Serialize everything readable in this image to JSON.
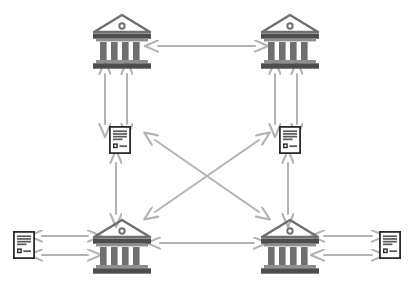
{
  "diagram": {
    "background_color": "#ffffff",
    "colors": {
      "bank_dark": "#4d4d4d",
      "bank_mid": "#6f6f6f",
      "bank_light": "#8f8f8f",
      "document_frame": "#2b2b2b",
      "document_line": "#5a5a5a",
      "document_paper": "#ffffff",
      "arrow": "#b3b3b3",
      "arrow_dark": "#a6a6a6"
    },
    "nodes": [
      {
        "id": "bank-top-left",
        "type": "bank-icon",
        "label": "Bank",
        "x": 122,
        "y": 42,
        "width": 62,
        "height": 58
      },
      {
        "id": "bank-top-right",
        "type": "bank-icon",
        "label": "Bank",
        "x": 290,
        "y": 42,
        "width": 62,
        "height": 58
      },
      {
        "id": "document-mid-left",
        "type": "document-icon",
        "label": "Document",
        "x": 120,
        "y": 140,
        "width": 22,
        "height": 28
      },
      {
        "id": "document-mid-right",
        "type": "document-icon",
        "label": "Document",
        "x": 290,
        "y": 140,
        "width": 22,
        "height": 28
      },
      {
        "id": "bank-bottom-left",
        "type": "bank-icon",
        "label": "Bank",
        "x": 122,
        "y": 247,
        "width": 62,
        "height": 58
      },
      {
        "id": "bank-bottom-right",
        "type": "bank-icon",
        "label": "Bank",
        "x": 290,
        "y": 247,
        "width": 62,
        "height": 58
      },
      {
        "id": "document-far-left",
        "type": "document-icon",
        "label": "Document",
        "x": 24,
        "y": 245,
        "width": 22,
        "height": 28
      },
      {
        "id": "document-far-right",
        "type": "document-icon",
        "label": "Document",
        "x": 390,
        "y": 245,
        "width": 22,
        "height": 28
      }
    ],
    "connectors": [
      {
        "id": "conn-top-banks",
        "name": "arrow-top-left-bank-to-top-right-bank",
        "style": "double-headed",
        "x1": 158,
        "y1": 46,
        "x2": 255,
        "y2": 46
      },
      {
        "id": "conn-tl-bank-doc-a",
        "name": "arrow-top-left-bank-to-left-document-a",
        "style": "double-headed",
        "x1": 105,
        "y1": 74,
        "x2": 105,
        "y2": 124
      },
      {
        "id": "conn-tl-bank-doc-b",
        "name": "arrow-top-left-bank-to-left-document-b",
        "style": "double-headed",
        "x1": 127,
        "y1": 74,
        "x2": 127,
        "y2": 124
      },
      {
        "id": "conn-tr-bank-doc-a",
        "name": "arrow-top-right-bank-to-right-document-a",
        "style": "double-headed",
        "x1": 275,
        "y1": 74,
        "x2": 275,
        "y2": 124
      },
      {
        "id": "conn-tr-bank-doc-b",
        "name": "arrow-top-right-bank-to-right-document-b",
        "style": "double-headed",
        "x1": 297,
        "y1": 74,
        "x2": 297,
        "y2": 124
      },
      {
        "id": "conn-left-doc-bl-bank",
        "name": "arrow-left-document-to-bottom-left-bank",
        "style": "double-headed",
        "x1": 116,
        "y1": 163,
        "x2": 116,
        "y2": 214
      },
      {
        "id": "conn-right-doc-br-bank",
        "name": "arrow-right-document-to-bottom-right-bank",
        "style": "double-headed",
        "x1": 288,
        "y1": 163,
        "x2": 288,
        "y2": 214
      },
      {
        "id": "conn-diagonal-nw-se",
        "name": "arrow-diagonal-left-document-to-bottom-right-bank",
        "style": "double-headed",
        "x1": 155,
        "y1": 140,
        "x2": 259,
        "y2": 212
      },
      {
        "id": "conn-diagonal-sw-ne",
        "name": "arrow-diagonal-bottom-left-bank-to-right-document",
        "style": "double-headed",
        "x1": 155,
        "y1": 212,
        "x2": 259,
        "y2": 140
      },
      {
        "id": "conn-bottom-banks",
        "name": "arrow-bottom-left-bank-to-bottom-right-bank",
        "style": "double-headed",
        "x1": 160,
        "y1": 243,
        "x2": 254,
        "y2": 243
      },
      {
        "id": "conn-far-left-doc-a",
        "name": "arrow-far-left-document-to-bottom-left-bank-a",
        "style": "double-headed",
        "x1": 42,
        "y1": 236,
        "x2": 88,
        "y2": 236
      },
      {
        "id": "conn-far-left-doc-b",
        "name": "arrow-far-left-document-to-bottom-left-bank-b",
        "style": "double-headed",
        "x1": 42,
        "y1": 255,
        "x2": 88,
        "y2": 255
      },
      {
        "id": "conn-far-right-doc-a",
        "name": "arrow-bottom-right-bank-to-far-right-document-a",
        "style": "double-headed",
        "x1": 324,
        "y1": 236,
        "x2": 372,
        "y2": 236
      },
      {
        "id": "conn-far-right-doc-b",
        "name": "arrow-bottom-right-bank-to-far-right-document-b",
        "style": "double-headed",
        "x1": 324,
        "y1": 255,
        "x2": 372,
        "y2": 255
      }
    ]
  }
}
